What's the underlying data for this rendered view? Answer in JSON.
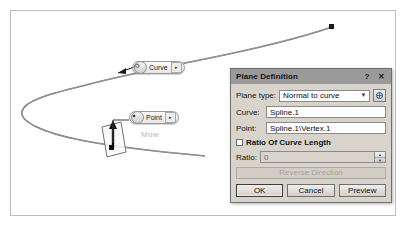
{
  "viewport": {
    "name": "cad-3d-viewport",
    "annotations": [
      {
        "id": "curve-annotation",
        "label": "Curve",
        "icon": "spline-curve-icon",
        "arrow": "▸"
      },
      {
        "id": "point-annotation",
        "label": "Point",
        "icon": "point-dot-icon",
        "arrow": "▸"
      }
    ],
    "ghost_label": "Mow",
    "geometry": {
      "spline_name": "Spline.1",
      "endpoint_marker": "square",
      "plane_preview": "parallelogram",
      "normal_arrow": "up-arrow"
    }
  },
  "dialog": {
    "title": "Plane Definition",
    "help_button": "?",
    "close_button": "✕",
    "plane_type": {
      "label": "Plane type:",
      "value": "Normal to curve",
      "caret": "▼",
      "options": [
        "Normal to curve"
      ]
    },
    "curve": {
      "label": "Curve:",
      "value": "Spline.1",
      "placeholder": ""
    },
    "point": {
      "label": "Point:",
      "value": "Spline.1\\Vertex.1",
      "placeholder": ""
    },
    "ratio_checkbox": {
      "label": "Ratio Of Curve Length",
      "checked": false
    },
    "ratio": {
      "label": "Ratio:",
      "value": "0",
      "spin_up": "▲",
      "spin_down": "▼"
    },
    "reverse_direction": {
      "label": "Reverse Direction",
      "enabled": false
    },
    "buttons": {
      "ok": "OK",
      "cancel": "Cancel",
      "preview": "Preview"
    }
  },
  "colors": {
    "titlebar": "#9a9a9a",
    "dialog_bg": "#d8d4cc",
    "field_bg": "#ffffff",
    "curve_stroke": "#6b6b6b",
    "frame_border": "#bdbdbd"
  }
}
